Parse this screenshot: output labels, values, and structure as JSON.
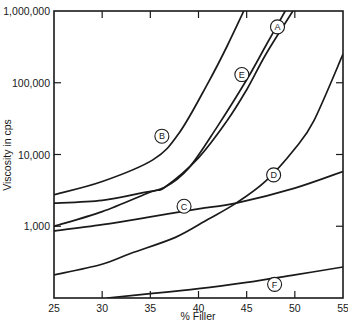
{
  "chart_data": {
    "type": "line",
    "title": "",
    "xlabel": "% Filler",
    "ylabel": "Viscosity in cps",
    "xscale": "linear",
    "yscale": "log",
    "xlim": [
      25,
      55
    ],
    "ylim": [
      100,
      1000000
    ],
    "x_ticks": [
      25,
      30,
      35,
      40,
      45,
      50,
      55
    ],
    "x_tick_labels": [
      "25",
      "30",
      "35",
      "40",
      "45",
      "50",
      "55"
    ],
    "y_ticks": [
      1000,
      10000,
      100000,
      1000000
    ],
    "y_tick_labels": [
      "1,000",
      "10,000",
      "100,000",
      "1,000,000"
    ],
    "grid": false,
    "legend": "inline circled letters",
    "series": [
      {
        "name": "A",
        "label_pos": [
          48.2,
          600000
        ],
        "points": [
          [
            25,
            1000
          ],
          [
            30,
            1600
          ],
          [
            35,
            3000
          ],
          [
            36.5,
            3500
          ],
          [
            40,
            9000
          ],
          [
            43,
            30000
          ],
          [
            45,
            80000
          ],
          [
            47,
            250000
          ],
          [
            49.8,
            1000000
          ]
        ]
      },
      {
        "name": "B",
        "label_pos": [
          36.2,
          18000
        ],
        "points": [
          [
            25,
            2750
          ],
          [
            30,
            4200
          ],
          [
            35.3,
            8500
          ],
          [
            38,
            20000
          ],
          [
            41,
            100000
          ],
          [
            43,
            330000
          ],
          [
            44.7,
            1000000
          ]
        ]
      },
      {
        "name": "C",
        "label_pos": [
          38.5,
          1900
        ],
        "points": [
          [
            25,
            860
          ],
          [
            30,
            1050
          ],
          [
            35,
            1350
          ],
          [
            40,
            1750
          ],
          [
            43.9,
            2100
          ],
          [
            50,
            3400
          ],
          [
            55,
            5800
          ]
        ]
      },
      {
        "name": "D",
        "label_pos": [
          47.8,
          5200
        ],
        "points": [
          [
            25,
            210
          ],
          [
            29.8,
            290
          ],
          [
            33,
            420
          ],
          [
            37.6,
            700
          ],
          [
            41,
            1250
          ],
          [
            43.9,
            2100
          ],
          [
            47,
            4300
          ],
          [
            50,
            12000
          ],
          [
            52,
            30000
          ],
          [
            55,
            250000
          ]
        ]
      },
      {
        "name": "E",
        "label_pos": [
          44.5,
          130000
        ],
        "points": [
          [
            25,
            2100
          ],
          [
            30,
            2300
          ],
          [
            34,
            2900
          ],
          [
            36.5,
            3500
          ],
          [
            39,
            6500
          ],
          [
            42,
            25000
          ],
          [
            45,
            110000
          ],
          [
            47,
            330000
          ],
          [
            49,
            1000000
          ]
        ]
      },
      {
        "name": "F",
        "label_pos": [
          47.9,
          155
        ],
        "points": [
          [
            30.5,
            100
          ],
          [
            35,
            115
          ],
          [
            40,
            135
          ],
          [
            45,
            165
          ],
          [
            50,
            210
          ],
          [
            55,
            270
          ]
        ]
      }
    ]
  },
  "chart_style": {
    "line_color": "#1a1a1a",
    "axis_color": "#1a1a1a",
    "background": "#ffffff"
  }
}
